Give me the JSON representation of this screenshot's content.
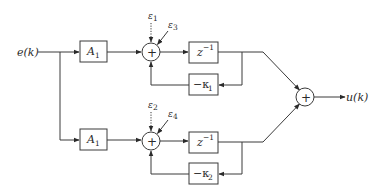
{
  "diagram": {
    "type": "block-diagram",
    "input": {
      "label": "e(k)"
    },
    "output": {
      "label": "u(k)"
    },
    "branches": [
      {
        "id": "top",
        "gain": {
          "label": "A",
          "sub": "1"
        },
        "sum_symbol": "+",
        "noise_dotted": {
          "label": "ε",
          "sub": "1"
        },
        "noise_solid": {
          "label": "ε",
          "sub": "3"
        },
        "delay": {
          "label": "z",
          "sup": "−1"
        },
        "feedback": {
          "label": "−κ",
          "sub": "1"
        }
      },
      {
        "id": "bottom",
        "gain": {
          "label": "A",
          "sub": "1"
        },
        "sum_symbol": "+",
        "noise_dotted": {
          "label": "ε",
          "sub": "2"
        },
        "noise_solid": {
          "label": "ε",
          "sub": "4"
        },
        "delay": {
          "label": "z",
          "sup": "−1"
        },
        "feedback": {
          "label": "−κ",
          "sub": "2"
        }
      }
    ],
    "output_sum_symbol": "+"
  }
}
